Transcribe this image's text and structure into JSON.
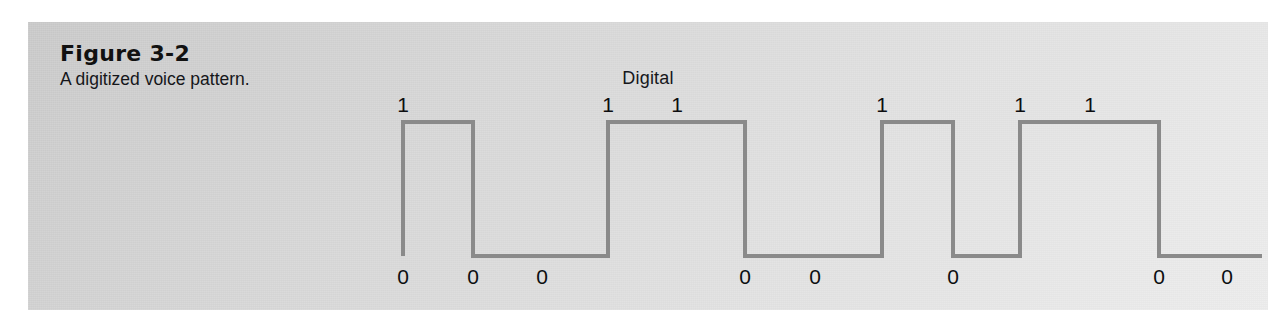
{
  "figure": {
    "number": "Figure 3-2",
    "caption": "A digitized voice pattern.",
    "panel_bg_light": "#ececec",
    "panel_bg_dark": "#c9c9c9"
  },
  "chart_data": {
    "type": "line",
    "title": "Digital",
    "subtitle": "",
    "xlabel": "",
    "ylabel": "",
    "grid": false,
    "legend": "none",
    "waveform_style": "square-wave",
    "line_color": "#8a8a8a",
    "line_width": 4,
    "levels": {
      "high": 1,
      "low": 0,
      "high_y_px": 122,
      "low_y_px": 256
    },
    "xlim": [
      403,
      1262
    ],
    "ylim": [
      0,
      1
    ],
    "bit_sequence": [
      1,
      0,
      0,
      1,
      1,
      0,
      0,
      1,
      0,
      1,
      1,
      0,
      0
    ],
    "x": [
      403,
      473,
      542,
      608,
      677,
      745,
      815,
      882,
      953,
      1020,
      1090,
      1159,
      1227
    ],
    "values": [
      1,
      0,
      0,
      1,
      1,
      0,
      0,
      1,
      0,
      1,
      1,
      0,
      0
    ],
    "transitions": [
      {
        "x": 403,
        "to": 1
      },
      {
        "x": 473,
        "to": 0
      },
      {
        "x": 608,
        "to": 1
      },
      {
        "x": 745,
        "to": 0
      },
      {
        "x": 882,
        "to": 1
      },
      {
        "x": 953,
        "to": 0
      },
      {
        "x": 1020,
        "to": 1
      },
      {
        "x": 1159,
        "to": 0
      },
      {
        "x": 1262,
        "to": 0
      }
    ],
    "annotations": [
      {
        "text": "1",
        "x": 403,
        "level": "high"
      },
      {
        "text": "0",
        "x": 403,
        "level": "low"
      },
      {
        "text": "0",
        "x": 473,
        "level": "low"
      },
      {
        "text": "0",
        "x": 542,
        "level": "low"
      },
      {
        "text": "1",
        "x": 608,
        "level": "high"
      },
      {
        "text": "1",
        "x": 677,
        "level": "high"
      },
      {
        "text": "0",
        "x": 745,
        "level": "low"
      },
      {
        "text": "0",
        "x": 815,
        "level": "low"
      },
      {
        "text": "1",
        "x": 882,
        "level": "high"
      },
      {
        "text": "0",
        "x": 953,
        "level": "low"
      },
      {
        "text": "1",
        "x": 1020,
        "level": "high"
      },
      {
        "text": "1",
        "x": 1090,
        "level": "high"
      },
      {
        "text": "0",
        "x": 1159,
        "level": "low"
      },
      {
        "text": "0",
        "x": 1227,
        "level": "low"
      }
    ]
  }
}
